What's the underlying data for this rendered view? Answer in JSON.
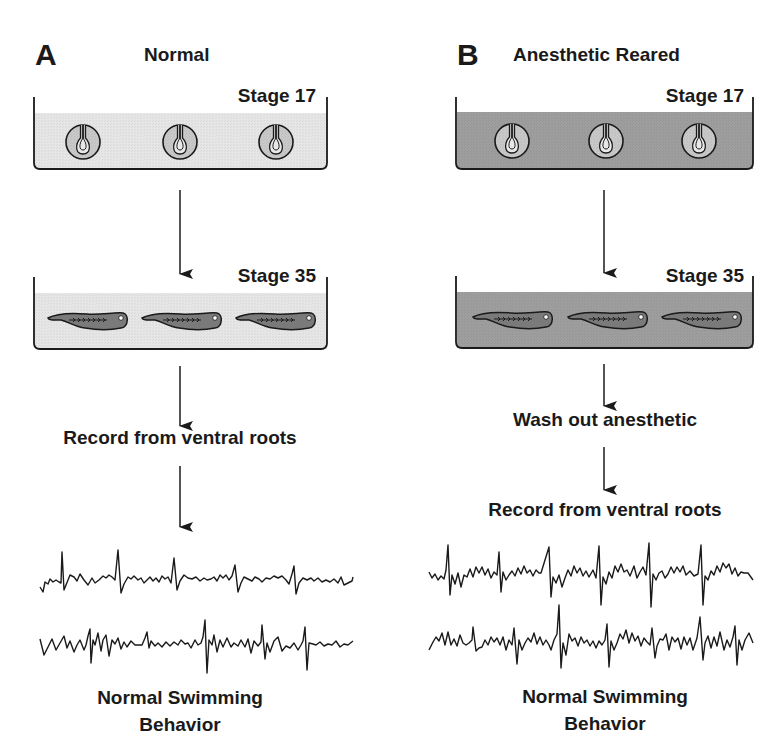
{
  "panels": [
    {
      "letter": "A",
      "title": "Normal",
      "water_color": "#e6e6e6",
      "stage1": "Stage 17",
      "stage2": "Stage 35",
      "steps": [
        "Record from ventral roots"
      ],
      "outcome": [
        "Normal Swimming",
        "Behavior"
      ]
    },
    {
      "letter": "B",
      "title": "Anesthetic Reared",
      "water_color": "#9e9e9e",
      "stage1": "Stage 17",
      "stage2": "Stage 35",
      "steps": [
        "Wash out anesthetic",
        "Record from ventral roots"
      ],
      "outcome": [
        "Normal Swimming",
        "Behavior"
      ]
    }
  ],
  "icons": {
    "embryo": "neural-tube-embryo-icon",
    "tadpole": "tadpole-icon",
    "arrow": "down-arrow-icon"
  },
  "colors": {
    "line": "#1a1a1a",
    "embryo_fill": "#c8c8c8",
    "tadpole_fill": "#7a7a7a"
  }
}
